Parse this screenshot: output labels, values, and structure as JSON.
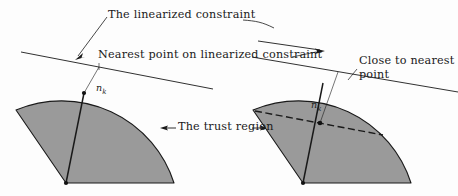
{
  "figure": {
    "background_color": "#fdfdfd",
    "ink_color": "#1a1a1a",
    "region_fill_color": "#9a9a9a",
    "region_stroke_color": "#1a1a1a",
    "labels": {
      "linearized_constraint": "The linearized constraint",
      "nearest_point": "Nearest point on linearized constraint",
      "close_to_nearest_point": "Close to nearest point",
      "trust_region": "The trust region",
      "n_k_symbol": "n",
      "n_k_subscript": "k"
    },
    "panels": [
      {
        "name": "left-panel",
        "description": "Trust region sector with nearest point on the linearized constraint outside the region",
        "n_k_label": "n_k"
      },
      {
        "name": "right-panel",
        "description": "Trust region sector with a dashed chord and a point close to the nearest point",
        "n_k_label": "n_k"
      }
    ]
  }
}
